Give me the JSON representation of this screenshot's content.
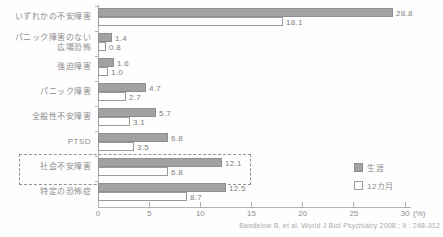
{
  "chart_data": {
    "type": "bar",
    "orientation": "horizontal",
    "title": "",
    "categories": [
      "いずれかの不安障害",
      "パニック障害のない\n広場恐怖",
      "強迫障害",
      "パニック障害",
      "全般性不安障害",
      "PTSD",
      "社会不安障害",
      "特定の恐怖症"
    ],
    "series": [
      {
        "name": "生涯",
        "style": "filled",
        "values": [
          28.8,
          1.4,
          1.6,
          4.7,
          5.7,
          6.8,
          12.1,
          12.5
        ]
      },
      {
        "name": "12カ月",
        "style": "outline",
        "values": [
          18.1,
          0.8,
          1.0,
          2.7,
          3.1,
          3.5,
          6.8,
          8.7
        ]
      }
    ],
    "xlim": [
      0,
      30
    ],
    "xticks": [
      0,
      5,
      10,
      15,
      20,
      25,
      30
    ],
    "x_unit_label": "(%)",
    "highlighted_category": "社会不安障害",
    "legend_position": "right-bottom",
    "grid": false
  },
  "colors": {
    "bar_fill": "#a2a2a2",
    "bar_border": "#8e8e8e",
    "outline_bar_fill": "#ffffff",
    "outline_bar_border": "#9a9a9a",
    "axis": "#b3b3b3",
    "label_text": "#8c8c8c",
    "value_text": "#7f7f7f",
    "highlight_box_border": "#949494",
    "citation_text": "#a8a8a8",
    "background": "#fefefe"
  },
  "citation": "Bandelow B, et al. World J Biol Psychiatry 2008 ; 9 : 248-312"
}
